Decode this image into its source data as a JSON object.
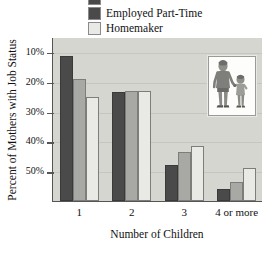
{
  "legend": {
    "position": "top",
    "items": [
      {
        "label": "",
        "color": "#4a4a4a",
        "clipped": true
      },
      {
        "label": "Employed Part-Time",
        "color": "#4a4a4a",
        "clipped": false
      },
      {
        "label": "Homemaker",
        "color": "#e9e9e5",
        "clipped": false
      }
    ]
  },
  "inset": {
    "name": "mother-and-child-illustration",
    "description": "Illustration of a woman holding a child's hand"
  },
  "axes": {
    "ytick_labels": [
      "50%",
      "40%",
      "30%",
      "20%",
      "10%"
    ],
    "ytick_values": [
      50,
      40,
      30,
      20,
      10
    ]
  },
  "colors": {
    "plot_background": "#d6d6d1",
    "series_dark": "#4a4a4a",
    "series_medium": "#a8a8a4",
    "series_light": "#e9e9e5",
    "axis": "#555555",
    "text": "#111111"
  },
  "chart_data": {
    "type": "bar",
    "title": "",
    "xlabel": "Number of Children",
    "ylabel": "Percent of Mothers with Job Status",
    "categories": [
      "1",
      "2",
      "3",
      "4 or more"
    ],
    "ylim": [
      0,
      55
    ],
    "yticks": [
      10,
      20,
      30,
      40,
      50
    ],
    "ytick_format": "percent",
    "grid": true,
    "legend_position": "top",
    "series": [
      {
        "name": "",
        "color": "#4a4a4a",
        "values": [
          48.5,
          36.5,
          12.0,
          4.0
        ]
      },
      {
        "name": "Employed Part-Time",
        "color": "#a8a8a4",
        "values": [
          41.0,
          37.0,
          16.5,
          6.5
        ]
      },
      {
        "name": "Homemaker",
        "color": "#e9e9e5",
        "values": [
          35.0,
          37.0,
          18.5,
          11.0
        ]
      }
    ]
  }
}
